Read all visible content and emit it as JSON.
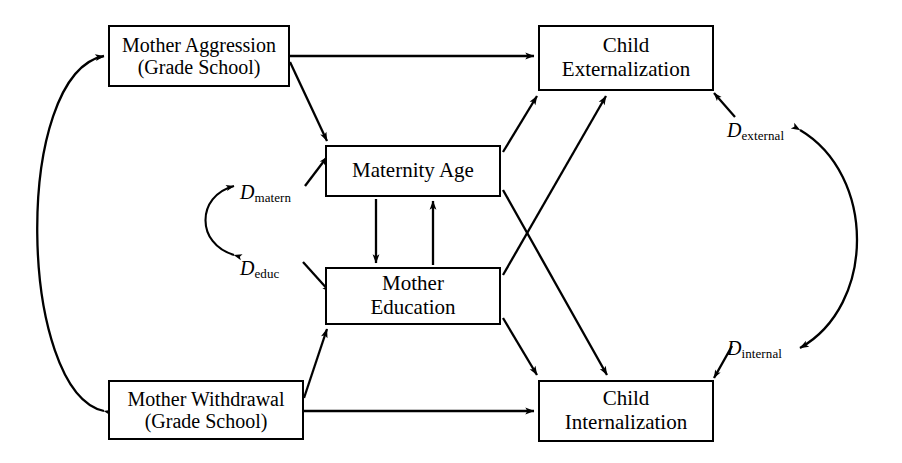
{
  "diagram": {
    "type": "structural-equation-path-diagram",
    "stroke_color": "#000000",
    "background_color": "#ffffff",
    "nodes": [
      {
        "id": "mother_aggression",
        "line1": "Mother Aggression",
        "line2": "(Grade School)",
        "x": 108,
        "y": 25,
        "w": 182,
        "h": 62
      },
      {
        "id": "child_externalization",
        "line1": "Child",
        "line2": "Externalization",
        "x": 538,
        "y": 25,
        "w": 176,
        "h": 66
      },
      {
        "id": "maternity_age",
        "line1": "Maternity Age",
        "line2": "",
        "x": 325,
        "y": 145,
        "w": 176,
        "h": 52
      },
      {
        "id": "mother_education",
        "line1": "Mother",
        "line2": "Education",
        "x": 325,
        "y": 267,
        "w": 176,
        "h": 58
      },
      {
        "id": "mother_withdrawal",
        "line1": "Mother Withdrawal",
        "line2": "(Grade School)",
        "x": 108,
        "y": 380,
        "w": 196,
        "h": 60
      },
      {
        "id": "child_internalization",
        "line1": "Child",
        "line2": "Internalization",
        "x": 538,
        "y": 380,
        "w": 176,
        "h": 62
      }
    ],
    "disturbances": [
      {
        "id": "d_matern",
        "symbol": "D",
        "subscript": "matern",
        "x": 240,
        "y": 182
      },
      {
        "id": "d_educ",
        "symbol": "D",
        "subscript": "educ",
        "x": 240,
        "y": 258
      },
      {
        "id": "d_external",
        "symbol": "D",
        "subscript": "external",
        "x": 727,
        "y": 120
      },
      {
        "id": "d_internal",
        "symbol": "D",
        "subscript": "internal",
        "x": 727,
        "y": 338
      }
    ],
    "edges": [
      {
        "from": "mother_aggression",
        "to": "child_externalization",
        "kind": "directed"
      },
      {
        "from": "mother_aggression",
        "to": "maternity_age",
        "kind": "directed"
      },
      {
        "from": "mother_withdrawal",
        "to": "child_internalization",
        "kind": "directed"
      },
      {
        "from": "mother_withdrawal",
        "to": "mother_education",
        "kind": "directed"
      },
      {
        "from": "maternity_age",
        "to": "child_externalization",
        "kind": "directed"
      },
      {
        "from": "maternity_age",
        "to": "child_internalization",
        "kind": "directed"
      },
      {
        "from": "mother_education",
        "to": "child_externalization",
        "kind": "directed"
      },
      {
        "from": "mother_education",
        "to": "child_internalization",
        "kind": "directed"
      },
      {
        "from": "maternity_age",
        "to": "mother_education",
        "kind": "directed"
      },
      {
        "from": "mother_education",
        "to": "maternity_age",
        "kind": "directed"
      },
      {
        "from": "d_matern",
        "to": "maternity_age",
        "kind": "directed"
      },
      {
        "from": "d_educ",
        "to": "mother_education",
        "kind": "directed"
      },
      {
        "from": "d_external",
        "to": "child_externalization",
        "kind": "directed"
      },
      {
        "from": "d_internal",
        "to": "child_internalization",
        "kind": "directed"
      },
      {
        "from": "mother_aggression",
        "to": "mother_withdrawal",
        "kind": "covariance"
      },
      {
        "from": "d_matern",
        "to": "d_educ",
        "kind": "covariance"
      },
      {
        "from": "d_external",
        "to": "d_internal",
        "kind": "covariance"
      }
    ]
  }
}
